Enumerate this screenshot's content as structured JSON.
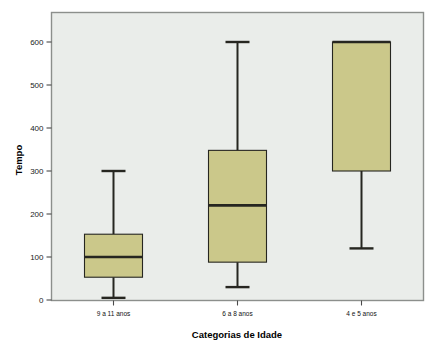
{
  "chart_data": {
    "type": "box",
    "title": "",
    "subtitle": "",
    "xlabel": "Categorias de Idade",
    "ylabel": "Tempo",
    "categories": [
      "9 a 11 anos",
      "6 a 8 anos",
      "4 e 5 anos"
    ],
    "ylim": [
      0,
      650
    ],
    "yticks": [
      0,
      100,
      200,
      300,
      400,
      500,
      600
    ],
    "ytick_labels": [
      "0",
      "100",
      "200",
      "300",
      "400",
      "500",
      "600"
    ],
    "grid": false,
    "legend": "none",
    "box_fill_color": "#cbc88a",
    "box_edge_color": "#262620",
    "plot_background_color": "#eaedea",
    "frame_color": "#8c8f8c",
    "page_background_color": "#ffffff",
    "boxes": [
      {
        "category": "9 a 11 anos",
        "whisker_low": 5,
        "q1": 53,
        "median": 100,
        "q3": 153,
        "whisker_high": 300
      },
      {
        "category": "6 a 8 anos",
        "whisker_low": 30,
        "q1": 88,
        "median": 220,
        "q3": 348,
        "whisker_high": 600
      },
      {
        "category": "4 e 5 anos",
        "whisker_low": 120,
        "q1": 300,
        "median": 600,
        "q3": 600,
        "whisker_high": 600
      }
    ]
  },
  "axes": {
    "y_axis_title": "Tempo",
    "x_axis_title": "Categorias de Idade"
  }
}
